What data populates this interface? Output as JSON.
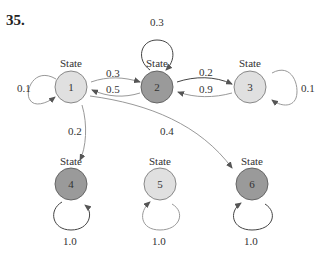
{
  "problem_number": "35.",
  "state_label": "State",
  "colors": {
    "light": "#e0e0e0",
    "dark": "#9a9a9a",
    "stroke": "#777777",
    "arrow": "#888888"
  },
  "states": [
    {
      "id": "1",
      "label": "State",
      "name": "1",
      "x": 71,
      "y": 87,
      "shade": "light"
    },
    {
      "id": "2",
      "label": "State",
      "name": "2",
      "x": 157,
      "y": 87,
      "shade": "dark"
    },
    {
      "id": "3",
      "label": "State",
      "name": "3",
      "x": 250,
      "y": 87,
      "shade": "light"
    },
    {
      "id": "4",
      "label": "State",
      "name": "4",
      "x": 71,
      "y": 184,
      "shade": "dark"
    },
    {
      "id": "5",
      "label": "State",
      "name": "5",
      "x": 160,
      "y": 184,
      "shade": "light"
    },
    {
      "id": "6",
      "label": "State",
      "name": "6",
      "x": 252,
      "y": 184,
      "shade": "dark"
    }
  ],
  "transitions": [
    {
      "from": "1",
      "to": "1",
      "p": "0.1"
    },
    {
      "from": "1",
      "to": "2",
      "p": "0.3"
    },
    {
      "from": "2",
      "to": "1",
      "p": "0.5"
    },
    {
      "from": "2",
      "to": "2",
      "p": "0.3"
    },
    {
      "from": "2",
      "to": "3",
      "p": "0.2"
    },
    {
      "from": "3",
      "to": "2",
      "p": "0.9"
    },
    {
      "from": "3",
      "to": "3",
      "p": "0.1"
    },
    {
      "from": "1",
      "to": "4",
      "p": "0.2"
    },
    {
      "from": "1",
      "to": "6",
      "p": "0.4"
    },
    {
      "from": "4",
      "to": "4",
      "p": "1.0"
    },
    {
      "from": "5",
      "to": "5",
      "p": "1.0"
    },
    {
      "from": "6",
      "to": "6",
      "p": "1.0"
    }
  ]
}
